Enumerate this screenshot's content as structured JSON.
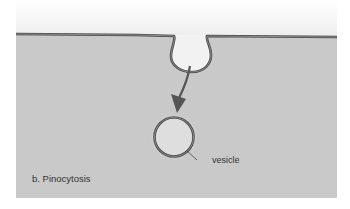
{
  "figure": {
    "caption": "b. Pinocytosis",
    "labels": {
      "vesicle": "vesicle"
    },
    "colors": {
      "extracellular_top": "#ffffff",
      "extracellular_bottom": "#ececec",
      "cytoplasm": "#c9c9c9",
      "membrane": "#5a5a5a",
      "membrane_inner": "#9a9a9a",
      "vesicle_fill": "#dedede",
      "arrow": "#555555"
    },
    "elements": [
      {
        "name": "plasma-membrane",
        "type": "line"
      },
      {
        "name": "membrane-invagination",
        "type": "pocket"
      },
      {
        "name": "arrow",
        "direction": "down-left"
      },
      {
        "name": "vesicle",
        "type": "circle"
      }
    ]
  }
}
